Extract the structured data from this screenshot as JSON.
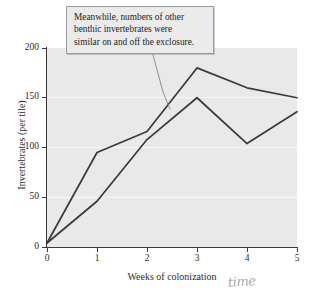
{
  "chart_data": {
    "type": "line",
    "title": "",
    "xlabel": "Weeks of colonization",
    "ylabel": "Invertebrates (per tile)",
    "x": [
      0,
      1,
      2,
      3,
      4,
      5
    ],
    "xlim": [
      0,
      5
    ],
    "ylim": [
      0,
      200
    ],
    "xticks": [
      "0",
      "1",
      "2",
      "3",
      "4",
      "5"
    ],
    "yticks": [
      "0",
      "50",
      "100",
      "150",
      "200"
    ],
    "grid": true,
    "legend": "none",
    "series": [
      {
        "name": "on exclosure",
        "color": "#3a3a3a",
        "values": [
          4,
          95,
          116,
          180,
          160,
          150
        ]
      },
      {
        "name": "off exclosure",
        "color": "#3a3a3a",
        "values": [
          4,
          46,
          108,
          150,
          104,
          136
        ]
      }
    ],
    "annotations": [
      {
        "name": "callout",
        "text": "Meanwhile, numbers of other benthic invertebrates were similar on and off the exclosure.",
        "lines": [
          "Meanwhile, numbers of other",
          "benthic invertebrates were",
          "similar on and off the exclosure."
        ]
      },
      {
        "name": "handwritten-note",
        "text": "time"
      }
    ]
  },
  "colors": {
    "plot_background": "#e9e9e9",
    "page_background": "#ffffff",
    "line": "#3a3a3a",
    "axis": "#3a3a3a",
    "gridline": "#f6f6f6",
    "callout_background": "#ebebeb",
    "callout_border": "#9a9a9a",
    "handwriting": "#a8a8a8"
  }
}
